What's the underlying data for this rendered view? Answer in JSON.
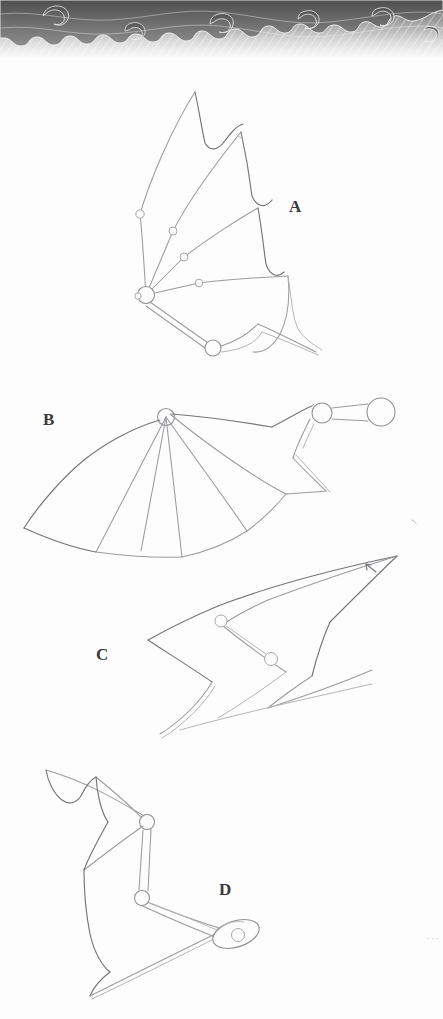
{
  "page": {
    "background_color": "#fdfdfd",
    "width": 443,
    "height": 1019,
    "medium": "pencil sketch on paper, scanned"
  },
  "banner": {
    "name": "decorative-flame-banner",
    "description": "Grayscale flame / swirl graphic band with diagonal hatching across the top edge of the page",
    "colors": {
      "dark": "#5b5b5b",
      "mid": "#8e8e8e",
      "light": "#d8d8d8",
      "highlight": "#f2f2f2"
    },
    "height_px": 58
  },
  "ink": {
    "pencil_light": "#b9b9bb",
    "pencil_mid": "#9a9a9e",
    "pencil_dark": "#6d6d72",
    "label_color": "#3a3a3a"
  },
  "sketches": [
    {
      "id": "A",
      "label": "A",
      "label_x": 294,
      "label_y": 207,
      "caption": "Bat wing spread upward — membrane with scalloped trailing edge, four finger struts radiating from a large shoulder joint, each strut carrying a small pivot circle; a double-bar lower arm runs down-right to a second large joint.",
      "joint_count": 7,
      "large_joints": 2,
      "small_joints": 5
    },
    {
      "id": "B",
      "label": "B",
      "label_x": 48,
      "label_y": 420,
      "caption": "Wing fully fanned out to the left from a single hub circle; five membrane panels with scalloped lower edge. At upper right a shoulder linkage of two circles joined by a capsule-shaped bar.",
      "joint_count": 3,
      "large_joints": 2,
      "small_joints": 1
    },
    {
      "id": "C",
      "label": "C",
      "label_x": 101,
      "label_y": 655,
      "caption": "Folded zig-zag wing profile, two chevron folds, with two pivot circles linked by a strut; a small arrow annotation at the upper right tip.",
      "joint_count": 2,
      "large_joints": 0,
      "small_joints": 2,
      "annotation": "arrow at upper-right tip"
    },
    {
      "id": "D",
      "label": "D",
      "label_x": 224,
      "label_y": 890,
      "caption": "Wing folded down the left side with three scalloped membrane lobes; an articulated two-bar arm descends from an upper joint through an elbow joint to a tapered oval end-effector containing a small circle.",
      "joint_count": 3,
      "large_joints": 0,
      "small_joints": 3
    }
  ],
  "corner_marks": {
    "name": "faint-dots",
    "text": "···",
    "x": 426,
    "y": 932
  }
}
